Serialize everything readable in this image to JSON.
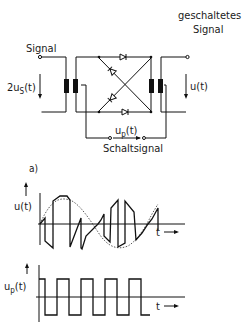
{
  "circuit": {
    "input_label": "Signal",
    "input_voltage": "2u",
    "input_voltage_sub": "S",
    "input_voltage_arg": "(t)",
    "output_label_line1": "geschaltetes",
    "output_label_line2": "Signal",
    "output_voltage": "u(t)",
    "switch_voltage": "u",
    "switch_voltage_sub": "p",
    "switch_voltage_arg": "(t)",
    "switch_label": "Schaltsignal",
    "subfigure": "a)"
  },
  "plot_top": {
    "ylabel": "u(t)",
    "xlabel": "t",
    "description": "switched signal: envelope sinusoid (dashed) chopped by square switching"
  },
  "plot_bottom": {
    "ylabel": "u",
    "ylabel_sub": "p",
    "ylabel_arg": "(t)",
    "xlabel": "t",
    "description": "square wave switching signal, 5 periods"
  },
  "colors": {
    "line": "#111111",
    "background": "#ffffff"
  }
}
